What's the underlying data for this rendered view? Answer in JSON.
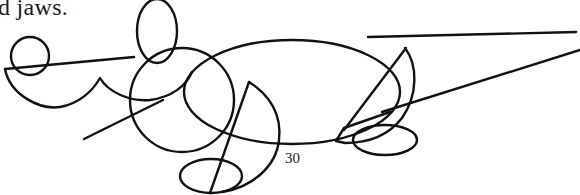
{
  "document": {
    "text_fragment": "d jaws.",
    "page_number": "30"
  },
  "figure": {
    "stroke_color": "#111111",
    "background_color": "#ffffff",
    "parts": [
      {
        "name": "small-ear-circle"
      },
      {
        "name": "tall-ear-loop"
      },
      {
        "name": "nose-line"
      },
      {
        "name": "snout-curve"
      },
      {
        "name": "head-circle"
      },
      {
        "name": "mouth-line"
      },
      {
        "name": "body-ellipse"
      },
      {
        "name": "front-leg"
      },
      {
        "name": "front-foot-ellipse"
      },
      {
        "name": "back-leg"
      },
      {
        "name": "back-foot-ellipse"
      },
      {
        "name": "tail-lines"
      }
    ]
  }
}
